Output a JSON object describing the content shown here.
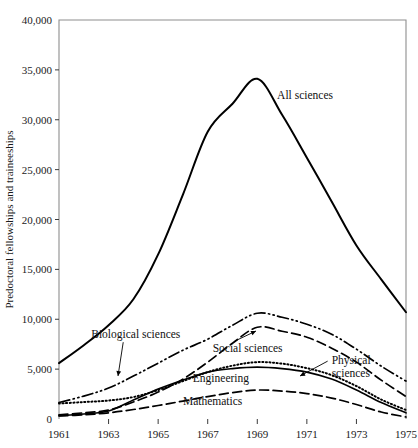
{
  "chart_data": {
    "type": "line",
    "title": "",
    "subtitle": "",
    "xlabel": "",
    "ylabel": "Predoctoral fellowships and traineeships",
    "xlim": [
      1961,
      1975
    ],
    "ylim": [
      0,
      40000
    ],
    "grid": false,
    "legend_position": "inline-annotations",
    "x_ticks": [
      1961,
      1963,
      1965,
      1967,
      1969,
      1971,
      1973,
      1975
    ],
    "x_tick_labels": [
      "1961",
      "1963",
      "1965",
      "1967",
      "1969",
      "1971",
      "1973",
      "1975"
    ],
    "y_ticks": [
      0,
      5000,
      10000,
      15000,
      20000,
      25000,
      30000,
      35000,
      40000
    ],
    "y_tick_labels": [
      "0",
      "5,000",
      "10,000",
      "15,000",
      "20,000",
      "25,000",
      "30,000",
      "35,000",
      "40,000"
    ],
    "x": [
      1961,
      1962,
      1963,
      1964,
      1965,
      1966,
      1967,
      1968,
      1969,
      1970,
      1971,
      1972,
      1973,
      1974,
      1975
    ],
    "series": [
      {
        "name": "All sciences",
        "label": "All sciences",
        "style": "solid",
        "values": [
          5600,
          7400,
          9400,
          12000,
          16500,
          22500,
          28800,
          31600,
          34100,
          30500,
          26200,
          21800,
          17400,
          14000,
          10700
        ]
      },
      {
        "name": "Biological sciences",
        "label": "Biological sciences",
        "style": "dash-dot-dot",
        "values": [
          1650,
          2300,
          3100,
          4300,
          5600,
          6900,
          8000,
          9400,
          10600,
          10200,
          9500,
          8500,
          7000,
          5300,
          3800
        ]
      },
      {
        "name": "Social sciences",
        "label": "Social sciences",
        "style": "long-dash",
        "values": [
          420,
          620,
          900,
          1700,
          2700,
          4000,
          5700,
          7600,
          9200,
          8800,
          8200,
          7100,
          5700,
          3900,
          2250
        ]
      },
      {
        "name": "Physical sciences",
        "label": "Physical sciences",
        "style": "dotted",
        "values": [
          1550,
          1700,
          1850,
          2200,
          2900,
          3800,
          4700,
          5350,
          5700,
          5550,
          5100,
          4400,
          3300,
          1950,
          900
        ]
      },
      {
        "name": "Engineering",
        "label": "Engineering",
        "style": "solid",
        "values": [
          340,
          500,
          800,
          1900,
          3000,
          3900,
          4700,
          5050,
          5200,
          5050,
          4700,
          4000,
          2900,
          1650,
          620
        ]
      },
      {
        "name": "Mathematics",
        "label": "Mathematics",
        "style": "long-dash",
        "values": [
          300,
          420,
          620,
          950,
          1350,
          1800,
          2250,
          2650,
          2900,
          2800,
          2550,
          2100,
          1450,
          700,
          200
        ]
      }
    ],
    "annotations": [
      {
        "text": "All sciences",
        "x": 1969.8,
        "y": 32100,
        "leader": false
      },
      {
        "text": "Biological sciences",
        "x": 1962.3,
        "y": 8100,
        "leader": true
      },
      {
        "text": "Social sciences",
        "x": 1967.2,
        "y": 6700,
        "leader": true
      },
      {
        "text": "Physical sciences",
        "x": 1972.0,
        "y": 5500,
        "leader": true
      },
      {
        "text": "Engineering",
        "x": 1966.4,
        "y": 3700,
        "leader": false
      },
      {
        "text": "Mathematics",
        "x": 1966.0,
        "y": 1450,
        "leader": false
      }
    ],
    "colors": {
      "line": "#000000",
      "frame": "#8e8e8e",
      "text": "#1a1a1a",
      "background": "#ffffff"
    }
  }
}
